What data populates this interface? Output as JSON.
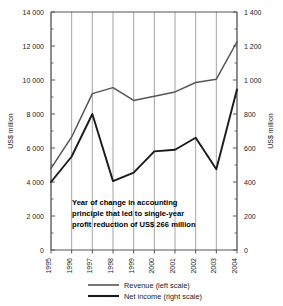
{
  "chart_data": {
    "type": "line",
    "title": "",
    "x": [
      "1995",
      "1996",
      "1997",
      "1998",
      "1999",
      "2000",
      "2001",
      "2002",
      "2003",
      "2004"
    ],
    "categories": [
      "1995",
      "1996",
      "1997",
      "1998",
      "1999",
      "2000",
      "2001",
      "2002",
      "2003",
      "2004"
    ],
    "series": [
      {
        "name": "Revenue (left scale)",
        "axis": "left",
        "color": "#555555",
        "values": [
          4800,
          6650,
          9200,
          9550,
          8800,
          9050,
          9300,
          9850,
          10050,
          12250
        ]
      },
      {
        "name": "Net income (right scale)",
        "axis": "right",
        "color": "#1a1a1a",
        "values": [
          400,
          550,
          800,
          405,
          455,
          580,
          590,
          660,
          475,
          945
        ]
      }
    ],
    "xlabel": "",
    "ylabel": "US$ million",
    "ylabel_right": "US$ million",
    "ylim": [
      0,
      14000
    ],
    "ylim_right": [
      0,
      1400
    ],
    "yticks": [
      0,
      2000,
      4000,
      6000,
      8000,
      10000,
      12000,
      14000
    ],
    "yticks_right": [
      0,
      200,
      400,
      600,
      800,
      1000,
      1200,
      1400
    ],
    "ytick_labels": [
      "0",
      "2 000",
      "4 000",
      "6 000",
      "8 000",
      "10 000",
      "12 000",
      "14 000"
    ],
    "ytick_labels_right": [
      "0",
      "200",
      "400",
      "600",
      "800",
      "1 000",
      "1 200",
      "1 400"
    ],
    "yminor_step": 1000,
    "yminor_step_right": 100,
    "grid": "vertical-only",
    "legend_position": "bottom-center",
    "annotations": [
      {
        "lines": [
          "Year of change in accounting",
          "principle that led to single-year",
          "profit reduction of US$ 266 million"
        ],
        "anchor_year": "1998"
      }
    ]
  },
  "axes": {
    "left_title": "US$ million",
    "right_title": "US$ million",
    "left_ticks": [
      "14 000",
      "12 000",
      "10 000",
      "8 000",
      "6 000",
      "4 000",
      "2 000",
      "0"
    ],
    "right_ticks": [
      "1 400",
      "1 200",
      "1 000",
      "800",
      "600",
      "400",
      "200",
      "0"
    ],
    "year_ticks": [
      "1995",
      "1996",
      "1997",
      "1998",
      "1999",
      "2000",
      "2001",
      "2002",
      "2003",
      "2004"
    ]
  },
  "annotation": {
    "line1": "Year of change in accounting",
    "line2": "principle that led to single-year",
    "line3": "profit reduction of US$ 266 million"
  },
  "legend": {
    "items": [
      {
        "label": "Revenue (left scale)",
        "color": "#555555"
      },
      {
        "label": "Net income (right scale)",
        "color": "#1a1a1a"
      }
    ],
    "revenue_label": "Revenue (left scale)",
    "net_income_label": "Net income (right scale)"
  },
  "colors": {
    "revenue": "#555555",
    "net_income": "#1a1a1a",
    "grid": "#9a9a9a",
    "frame": "#555555",
    "text": "#1a1a1a",
    "background": "#ffffff"
  }
}
